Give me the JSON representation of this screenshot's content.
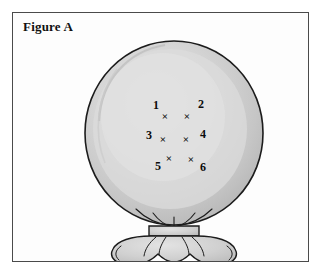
{
  "figure": {
    "title": "Figure A",
    "caption_position": "top-left"
  },
  "illustration": {
    "subject": "balloon",
    "subject_icon": "balloon-icon",
    "knot_icon": "balloon-knot-icon",
    "colors": {
      "outline": "#1c1c1c",
      "balloon_fill": "#c9c9c9",
      "balloon_highlight": "#dddddd",
      "balloon_inner_highlight": "#e6e6e6",
      "knot_fill": "#d2d2d2",
      "frame_border": "#4a4a4a",
      "page_background": "#ffffff",
      "marker_color": "#0c0c0c"
    },
    "balloon_geometry": {
      "center_x": 161,
      "center_y": 120,
      "radius_x": 89,
      "radius_y": 92
    }
  },
  "markers": {
    "symbol": "×",
    "count": 6,
    "items": [
      {
        "id": "1",
        "label": "1",
        "x": 152,
        "y": 103,
        "label_x": 143,
        "label_y": 92,
        "label_position": "above-left"
      },
      {
        "id": "2",
        "label": "2",
        "x": 174,
        "y": 103,
        "label_x": 188,
        "label_y": 91,
        "label_position": "above-right"
      },
      {
        "id": "3",
        "label": "3",
        "x": 150,
        "y": 126,
        "label_x": 136,
        "label_y": 122,
        "label_position": "left"
      },
      {
        "id": "4",
        "label": "4",
        "x": 173,
        "y": 126,
        "label_x": 190,
        "label_y": 121,
        "label_position": "right"
      },
      {
        "id": "5",
        "label": "5",
        "x": 156,
        "y": 145,
        "label_x": 145,
        "label_y": 153,
        "label_position": "below-left"
      },
      {
        "id": "6",
        "label": "6",
        "x": 178,
        "y": 146,
        "label_x": 190,
        "label_y": 154,
        "label_position": "below-right"
      }
    ]
  }
}
